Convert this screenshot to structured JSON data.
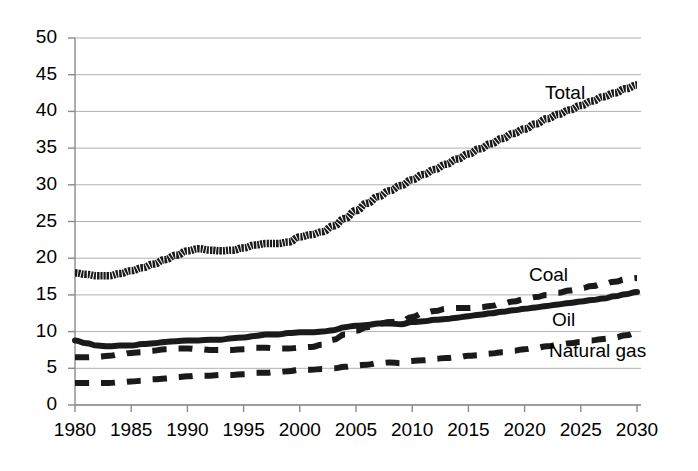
{
  "chart_data": {
    "type": "line",
    "title": "",
    "xlabel": "",
    "ylabel": "",
    "xlim": [
      1980,
      2030
    ],
    "ylim": [
      0,
      50
    ],
    "grid": true,
    "legend_position": "inline-annotations",
    "x_ticks": [
      "1980",
      "1985",
      "1990",
      "1995",
      "2000",
      "2005",
      "2010",
      "2015",
      "2020",
      "2025",
      "2030"
    ],
    "y_ticks": [
      "0",
      "5",
      "10",
      "15",
      "20",
      "25",
      "30",
      "35",
      "40",
      "45",
      "50"
    ],
    "x": [
      1980,
      1981,
      1982,
      1983,
      1984,
      1985,
      1986,
      1987,
      1988,
      1989,
      1990,
      1991,
      1992,
      1993,
      1994,
      1995,
      1996,
      1997,
      1998,
      1999,
      2000,
      2001,
      2002,
      2003,
      2004,
      2005,
      2006,
      2007,
      2008,
      2009,
      2010,
      2011,
      2012,
      2013,
      2014,
      2015,
      2016,
      2017,
      2018,
      2019,
      2020,
      2021,
      2022,
      2023,
      2024,
      2025,
      2026,
      2027,
      2028,
      2029,
      2030
    ],
    "series": [
      {
        "name": "Total",
        "style": "thick-textured",
        "values": [
          18.0,
          17.8,
          17.6,
          17.6,
          17.9,
          18.3,
          18.7,
          19.2,
          19.8,
          20.4,
          21.0,
          21.3,
          21.1,
          21.0,
          21.1,
          21.4,
          21.8,
          22.0,
          22.0,
          22.2,
          22.9,
          23.2,
          23.6,
          24.4,
          25.4,
          26.5,
          27.5,
          28.4,
          29.2,
          29.9,
          30.7,
          31.4,
          32.1,
          32.8,
          33.5,
          34.2,
          34.9,
          35.6,
          36.3,
          37.0,
          37.6,
          38.3,
          39.0,
          39.6,
          40.2,
          40.8,
          41.4,
          42.0,
          42.5,
          43.1,
          43.6
        ]
      },
      {
        "name": "Oil",
        "style": "thick-solid",
        "values": [
          8.8,
          8.4,
          8.1,
          8.0,
          8.1,
          8.1,
          8.3,
          8.4,
          8.6,
          8.7,
          8.8,
          8.8,
          8.9,
          8.9,
          9.1,
          9.2,
          9.4,
          9.6,
          9.6,
          9.8,
          9.9,
          9.9,
          10.0,
          10.2,
          10.6,
          10.8,
          10.9,
          11.1,
          11.1,
          11.0,
          11.3,
          11.4,
          11.6,
          11.7,
          11.9,
          12.1,
          12.3,
          12.5,
          12.7,
          12.9,
          13.1,
          13.3,
          13.5,
          13.7,
          13.9,
          14.1,
          14.3,
          14.5,
          14.8,
          15.1,
          15.4
        ]
      },
      {
        "name": "Coal",
        "style": "dashed",
        "values": [
          6.5,
          6.5,
          6.6,
          6.7,
          6.9,
          7.1,
          7.2,
          7.4,
          7.6,
          7.7,
          7.7,
          7.6,
          7.5,
          7.5,
          7.5,
          7.6,
          7.8,
          7.8,
          7.7,
          7.7,
          7.8,
          7.9,
          8.2,
          8.9,
          9.6,
          10.1,
          10.6,
          11.1,
          11.3,
          11.4,
          12.0,
          12.5,
          12.8,
          13.1,
          13.2,
          13.2,
          13.3,
          13.5,
          13.8,
          14.1,
          14.4,
          14.7,
          15.0,
          15.3,
          15.6,
          15.9,
          16.2,
          16.5,
          16.8,
          17.1,
          17.3
        ]
      },
      {
        "name": "Natural gas",
        "style": "dashed",
        "values": [
          3.0,
          3.0,
          3.0,
          3.0,
          3.1,
          3.2,
          3.3,
          3.5,
          3.6,
          3.8,
          3.9,
          4.0,
          4.0,
          4.1,
          4.1,
          4.2,
          4.4,
          4.4,
          4.5,
          4.6,
          4.8,
          4.8,
          4.9,
          5.0,
          5.2,
          5.4,
          5.5,
          5.7,
          5.8,
          5.7,
          6.0,
          6.1,
          6.3,
          6.4,
          6.5,
          6.7,
          6.8,
          7.0,
          7.2,
          7.4,
          7.6,
          7.8,
          8.0,
          8.2,
          8.4,
          8.6,
          8.8,
          9.0,
          9.2,
          9.5,
          9.8
        ]
      }
    ],
    "annotations": [
      {
        "text": "Total",
        "x_px": 545,
        "y_px": 82
      },
      {
        "text": "Coal",
        "x_px": 529,
        "y_px": 264
      },
      {
        "text": "Oil",
        "x_px": 552,
        "y_px": 309
      },
      {
        "text": "Natural gas",
        "x_px": 549,
        "y_px": 340
      }
    ],
    "colors": {
      "line": "#1a1a1a",
      "grid": "#b0b0b0",
      "axis": "#808080",
      "background": "#ffffff",
      "text": "#000000"
    }
  }
}
